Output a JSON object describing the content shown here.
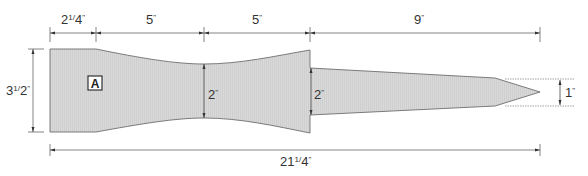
{
  "diagram": {
    "piece_label": "A",
    "colors": {
      "fill": "#d6d6d6",
      "stroke": "#6e6e6e",
      "dim_line": "#555555",
      "text": "#333333"
    },
    "top_dimensions": [
      {
        "whole": "2",
        "frac_num": "1",
        "frac_den": "4",
        "unit": "\""
      },
      {
        "whole": "5",
        "unit": "\""
      },
      {
        "whole": "5",
        "unit": "\""
      },
      {
        "whole": "9",
        "unit": "\""
      }
    ],
    "height_dimension": {
      "whole": "3",
      "frac_num": "1",
      "frac_den": "2",
      "unit": "\""
    },
    "waist_dimension": {
      "whole": "2",
      "unit": "\""
    },
    "step_dimension": {
      "whole": "2",
      "unit": "\""
    },
    "tip_dimension": {
      "whole": "1",
      "unit": "\""
    },
    "overall_length": {
      "whole": "21",
      "frac_num": "1",
      "frac_den": "4",
      "unit": "\""
    }
  }
}
